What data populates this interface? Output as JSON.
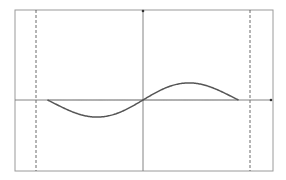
{
  "chart_data": {
    "type": "line",
    "title": "",
    "xlabel": "",
    "ylabel": "",
    "grid": false,
    "legend": null,
    "xlim": [
      -1.12,
      1.22
    ],
    "ylim": [
      -0.75,
      0.75
    ],
    "x_axis_position": 0,
    "y_axis_position": 0,
    "vertical_dashed_lines": [
      -1.12,
      1.12
    ],
    "series": [
      {
        "name": "light-curve",
        "style": "thin light gray",
        "color": "#9a9a9a",
        "description": "Symmetric wavelet-like curve: zero at ends, deep minima near ±0.77, central peak at 0",
        "x": [
          -1.0,
          -0.9,
          -0.8,
          -0.77,
          -0.7,
          -0.6,
          -0.5,
          -0.4,
          -0.3,
          -0.2,
          -0.1,
          0.0,
          0.1,
          0.2,
          0.3,
          0.4,
          0.5,
          0.6,
          0.7,
          0.77,
          0.8,
          0.9,
          1.0
        ],
        "y": [
          0.0,
          -0.35,
          -0.57,
          -0.59,
          -0.55,
          -0.38,
          -0.12,
          0.12,
          0.33,
          0.48,
          0.57,
          0.61,
          0.57,
          0.48,
          0.33,
          0.12,
          -0.12,
          -0.38,
          -0.55,
          -0.59,
          -0.57,
          -0.35,
          0.0
        ]
      },
      {
        "name": "dark-curve",
        "style": "thicker dark gray",
        "color": "#555555",
        "description": "Antisymmetric curve: minimum near -0.5, passes through origin, maximum near +0.5",
        "x": [
          -1.0,
          -0.9,
          -0.8,
          -0.7,
          -0.6,
          -0.5,
          -0.4,
          -0.3,
          -0.2,
          -0.1,
          0.0,
          0.1,
          0.2,
          0.3,
          0.4,
          0.5,
          0.6,
          0.7,
          0.8,
          0.9,
          1.0
        ],
        "y": [
          0.0,
          -0.02,
          -0.06,
          -0.11,
          -0.15,
          -0.17,
          -0.16,
          -0.13,
          -0.09,
          -0.05,
          0.0,
          0.05,
          0.09,
          0.13,
          0.16,
          0.17,
          0.15,
          0.11,
          0.06,
          0.02,
          0.0
        ]
      }
    ]
  },
  "render": {
    "frame": {
      "left": 15,
      "top": 10,
      "right": 273,
      "bottom": 171
    },
    "origin_px": {
      "x": 143,
      "y": 100
    },
    "x_scale_px": 95.5,
    "y_scale_px": 102,
    "frame_color": "#9a9a9a",
    "axis_color": "#777777",
    "dashed_color": "#444444"
  }
}
